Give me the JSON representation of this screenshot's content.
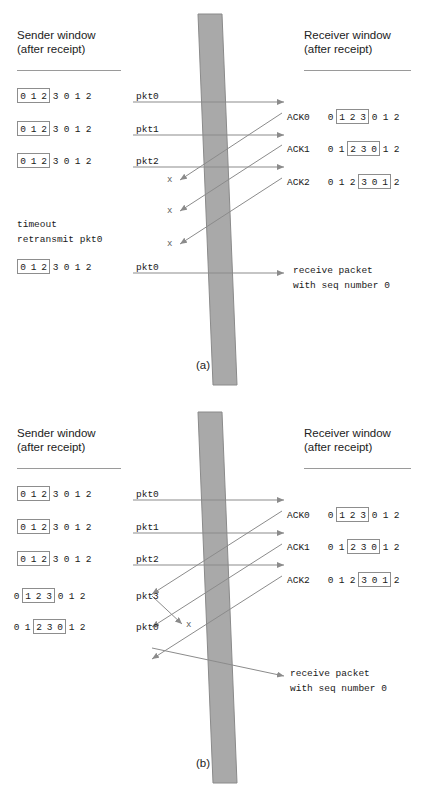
{
  "figure": {
    "colors": {
      "medium_fill": "#a9a9a9",
      "medium_stroke": "#8a8a8a",
      "arrow": "#8b8b8b",
      "box_border": "#8d8d8d",
      "text": "#1a1a1a"
    },
    "panels": [
      {
        "id": "a",
        "caption": "(a)",
        "sender_header": {
          "line1": "Sender window",
          "line2": "(after receipt)"
        },
        "receiver_header": {
          "line1": "Receiver window",
          "line2": "(after receipt)"
        },
        "sender_rows": [
          {
            "seq": [
              "0",
              "1",
              "2",
              "3",
              "0",
              "1",
              "2"
            ],
            "window": [
              0,
              2
            ],
            "label": "pkt0"
          },
          {
            "seq": [
              "0",
              "1",
              "2",
              "3",
              "0",
              "1",
              "2"
            ],
            "window": [
              0,
              2
            ],
            "label": "pkt1"
          },
          {
            "seq": [
              "0",
              "1",
              "2",
              "3",
              "0",
              "1",
              "2"
            ],
            "window": [
              0,
              2
            ],
            "label": "pkt2"
          },
          {
            "seq": [
              "0",
              "1",
              "2",
              "3",
              "0",
              "1",
              "2"
            ],
            "window": [
              0,
              2
            ],
            "label": "pkt0"
          }
        ],
        "sender_notes": [
          "timeout",
          "retransmit pkt0"
        ],
        "receiver_rows": [
          {
            "ack": "ACK0",
            "seq": [
              "0",
              "1",
              "2",
              "3",
              "0",
              "1",
              "2"
            ],
            "window": [
              1,
              3
            ]
          },
          {
            "ack": "ACK1",
            "seq": [
              "0",
              "1",
              "2",
              "3",
              "0",
              "1",
              "2"
            ],
            "window": [
              2,
              4
            ]
          },
          {
            "ack": "ACK2",
            "seq": [
              "0",
              "1",
              "2",
              "3",
              "0",
              "1",
              "2"
            ],
            "window": [
              3,
              5
            ]
          }
        ],
        "receiver_notes": [
          "receive packet",
          "with seq number 0"
        ],
        "lost_marks": [
          "x",
          "x",
          "x"
        ]
      },
      {
        "id": "b",
        "caption": "(b)",
        "sender_header": {
          "line1": "Sender window",
          "line2": "(after receipt)"
        },
        "receiver_header": {
          "line1": "Receiver window",
          "line2": "(after receipt)"
        },
        "sender_rows": [
          {
            "seq": [
              "0",
              "1",
              "2",
              "3",
              "0",
              "1",
              "2"
            ],
            "window": [
              0,
              2
            ],
            "label": "pkt0"
          },
          {
            "seq": [
              "0",
              "1",
              "2",
              "3",
              "0",
              "1",
              "2"
            ],
            "window": [
              0,
              2
            ],
            "label": "pkt1"
          },
          {
            "seq": [
              "0",
              "1",
              "2",
              "3",
              "0",
              "1",
              "2"
            ],
            "window": [
              0,
              2
            ],
            "label": "pkt2"
          },
          {
            "seq": [
              "0",
              "1",
              "2",
              "3",
              "0",
              "1",
              "2"
            ],
            "window": [
              1,
              3
            ],
            "label": "pkt3"
          },
          {
            "seq": [
              "0",
              "1",
              "2",
              "3",
              "0",
              "1",
              "2"
            ],
            "window": [
              2,
              4
            ],
            "label": "pkt0"
          }
        ],
        "sender_notes": [],
        "receiver_rows": [
          {
            "ack": "ACK0",
            "seq": [
              "0",
              "1",
              "2",
              "3",
              "0",
              "1",
              "2"
            ],
            "window": [
              1,
              3
            ]
          },
          {
            "ack": "ACK1",
            "seq": [
              "0",
              "1",
              "2",
              "3",
              "0",
              "1",
              "2"
            ],
            "window": [
              2,
              4
            ]
          },
          {
            "ack": "ACK2",
            "seq": [
              "0",
              "1",
              "2",
              "3",
              "0",
              "1",
              "2"
            ],
            "window": [
              3,
              5
            ]
          }
        ],
        "receiver_notes": [
          "receive packet",
          "with seq number 0"
        ],
        "lost_marks": [
          "x"
        ]
      }
    ]
  }
}
